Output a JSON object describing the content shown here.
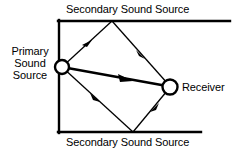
{
  "diagram": {
    "labels": {
      "secondary_top": "Secondary Sound Source",
      "secondary_bottom": "Secondary Sound Source",
      "receiver": "Receiver",
      "primary_line1": "Primary",
      "primary_line2": "Sound",
      "primary_line3": "Source"
    },
    "colors": {
      "stroke": "#000000",
      "background": "#ffffff"
    },
    "geometry": {
      "walls": {
        "top": {
          "x1": 58,
          "y1": 21,
          "x2": 230,
          "y2": 21
        },
        "bottom": {
          "x1": 58,
          "y1": 132,
          "x2": 201,
          "y2": 132
        },
        "left": {
          "x1": 59,
          "y1": 21,
          "x2": 59,
          "y2": 132
        }
      },
      "primary_source": {
        "cx": 62,
        "cy": 67,
        "r": 7
      },
      "receiver": {
        "cx": 170,
        "cy": 87,
        "r": 7
      },
      "reflection_top": {
        "x": 112,
        "y": 21
      },
      "reflection_bottom": {
        "x": 133,
        "y": 132
      },
      "paths": [
        {
          "name": "direct-path",
          "from": [
            62,
            67
          ],
          "to": [
            170,
            87
          ],
          "bold": true,
          "arrow_at": [
            128,
            79
          ]
        },
        {
          "name": "upper-incident-path",
          "from": [
            62,
            67
          ],
          "to": [
            112,
            21
          ],
          "arrow_at": [
            88,
            44
          ]
        },
        {
          "name": "upper-reflected-path",
          "from": [
            112,
            21
          ],
          "to": [
            170,
            87
          ],
          "arrow_at": [
            142,
            55
          ]
        },
        {
          "name": "lower-incident-path",
          "from": [
            62,
            67
          ],
          "to": [
            133,
            132
          ],
          "arrow_at": [
            96,
            98
          ]
        },
        {
          "name": "lower-reflected-path",
          "from": [
            133,
            132
          ],
          "to": [
            170,
            87
          ],
          "arrow_at": [
            155,
            107
          ]
        }
      ]
    }
  }
}
